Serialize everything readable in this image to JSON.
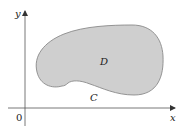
{
  "diagram": {
    "type": "region-with-boundary",
    "axes": {
      "x_label": "x",
      "y_label": "y",
      "origin_label": "0"
    },
    "region": {
      "label": "D",
      "fill_color": "#cfcfcf",
      "stroke_color": "#8a8a8a"
    },
    "boundary": {
      "label": "C"
    },
    "colors": {
      "axis": "#555555",
      "background": "#ffffff"
    }
  }
}
